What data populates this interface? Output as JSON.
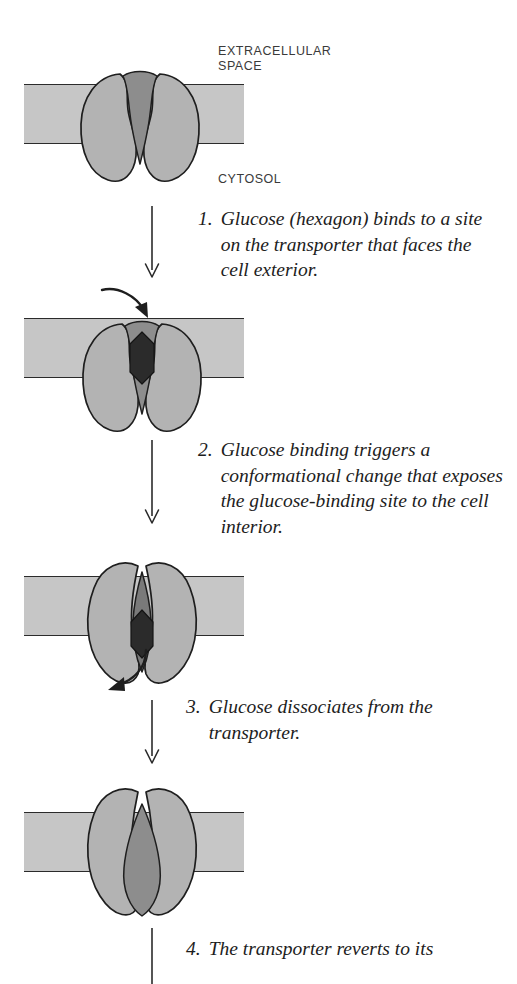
{
  "figure": {
    "title_semantic": "glucose-transporter-conformational-cycle",
    "membrane_labels": {
      "top": "EXTRACELLULAR\nSPACE",
      "bottom": "CYTOSOL"
    },
    "colors": {
      "membrane": "#c6c6c6",
      "protein_lobe": "#b3b3b3",
      "channel_cavity": "#8d8d8d",
      "channel_cavity_dark": "#7a7a7a",
      "glucose_hexagon": "#2b2b2b",
      "outline": "#1e1e1e",
      "background": "#ffffff",
      "label_text": "#3a3a3a",
      "caption_text": "#1d1d1d"
    },
    "steps": [
      {
        "number": "1.",
        "text": "Glucose (hexagon) binds to a site on the transporter that faces the cell exterior.",
        "state": "outward-open-empty"
      },
      {
        "number": "2.",
        "text": "Glucose binding triggers a conformational change that exposes the glucose-binding site to the cell interior.",
        "state": "outward-open-glucose-bound"
      },
      {
        "number": "3.",
        "text": "Glucose dissociates from the transporter.",
        "state": "inward-open-glucose-bound"
      },
      {
        "number": "4.",
        "text": "The transporter reverts to its",
        "state": "inward-open-empty"
      }
    ],
    "arrows": {
      "step_arrow_name": "downward-step-arrow",
      "glucose_binding_arrow": "curved-arrow-glucose-entering",
      "glucose_release_arrow": "curved-arrow-glucose-exiting"
    }
  }
}
